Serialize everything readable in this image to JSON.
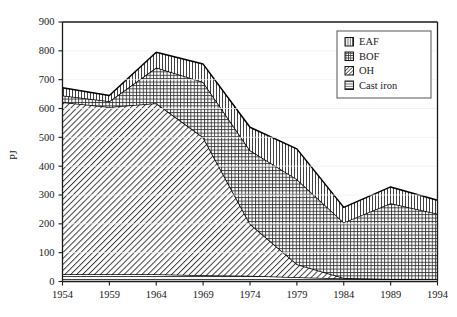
{
  "chart_data": {
    "type": "area",
    "stacked": true,
    "title": "",
    "subtitle": "",
    "xlabel": "",
    "ylabel": "PJ",
    "x": [
      1954,
      1959,
      1964,
      1969,
      1974,
      1979,
      1984,
      1989,
      1994
    ],
    "xtick_labels": [
      "1954",
      "1959",
      "1964",
      "1969",
      "1974",
      "1979",
      "1984",
      "1989",
      "1994"
    ],
    "xlim": [
      1954,
      1994
    ],
    "ylim": [
      0,
      900
    ],
    "ytick_labels": [
      "0",
      "100",
      "200",
      "300",
      "400",
      "500",
      "600",
      "700",
      "800",
      "900"
    ],
    "yticks": [
      0,
      100,
      200,
      300,
      400,
      500,
      600,
      700,
      800,
      900
    ],
    "grid": false,
    "legend_position": "top-right",
    "stack_order_bottom_to_top": [
      "Cast iron",
      "OH",
      "BOF",
      "EAF"
    ],
    "series": [
      {
        "name": "Cast iron",
        "pattern": "horizontal-lines",
        "values": [
          25,
          25,
          25,
          22,
          20,
          15,
          10,
          9,
          8
        ]
      },
      {
        "name": "OH",
        "pattern": "diagonal-hatch",
        "values": [
          597,
          580,
          593,
          478,
          180,
          45,
          2,
          0,
          0
        ]
      },
      {
        "name": "BOF",
        "pattern": "cross-hatch",
        "values": [
          23,
          20,
          124,
          192,
          255,
          295,
          193,
          262,
          227
        ]
      },
      {
        "name": "EAF",
        "pattern": "vertical-lines",
        "values": [
          27,
          20,
          53,
          62,
          80,
          105,
          52,
          57,
          47
        ]
      }
    ],
    "cumulative_tops": {
      "cast_iron": [
        25,
        25,
        25,
        22,
        20,
        15,
        10,
        9,
        8
      ],
      "oh": [
        622,
        605,
        618,
        500,
        200,
        60,
        12,
        9,
        8
      ],
      "bof": [
        645,
        625,
        742,
        692,
        455,
        355,
        205,
        271,
        235
      ],
      "eaf": [
        672,
        645,
        795,
        754,
        535,
        460,
        257,
        328,
        282
      ]
    }
  },
  "legend": {
    "items": [
      {
        "label": "EAF",
        "swatch": "vertical-lines-swatch"
      },
      {
        "label": "BOF",
        "swatch": "cross-hatch-swatch"
      },
      {
        "label": "OH",
        "swatch": "diagonal-hatch-swatch"
      },
      {
        "label": "Cast iron",
        "swatch": "horizontal-lines-swatch"
      }
    ]
  },
  "colors": {
    "axis": "#1a1a1a",
    "line": "#000000",
    "fill": "#ffffff",
    "hatch": "#333333",
    "background": "#ffffff"
  }
}
